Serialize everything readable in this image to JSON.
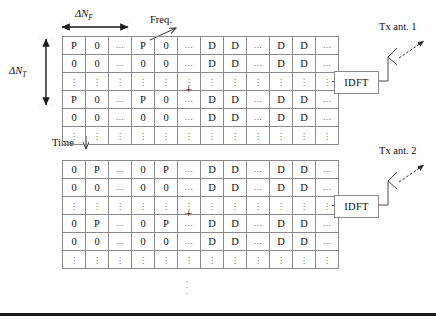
{
  "figure": {
    "axis_labels": {
      "frequency": "Freq.",
      "time": "Time",
      "delta_nf": "ΔN",
      "delta_nf_sub": "F",
      "delta_nt": "ΔN",
      "delta_nt_sub": "T"
    },
    "operator": "+",
    "block_label": "IDFT",
    "ellipsis_h": "...",
    "ellipsis_v": "⋮",
    "continuation_dots": [
      "·",
      "·",
      "·"
    ],
    "colors": {
      "grid_line": "#8a8a8a",
      "connector": "#4a4a4a",
      "text": "#111111",
      "rule": "#1a1a1a",
      "background": "#ffffff"
    },
    "branches": [
      {
        "id": "branch-1",
        "antenna_label": "Tx ant. 1",
        "pilot_grid": {
          "name": "pilot-grid-antenna-1",
          "columns": 6,
          "rows": [
            [
              "P",
              "0",
              "...",
              "P",
              "0",
              "..."
            ],
            [
              "0",
              "0",
              "...",
              "0",
              "0",
              "..."
            ],
            [
              "⋮",
              "⋮",
              "⋮",
              "⋮",
              "⋮",
              "⋮"
            ],
            [
              "P",
              "0",
              "...",
              "P",
              "0",
              "..."
            ],
            [
              "0",
              "0",
              "...",
              "0",
              "0",
              "..."
            ],
            [
              "⋮",
              "⋮",
              "⋮",
              "⋮",
              "⋮",
              "⋮"
            ]
          ]
        },
        "data_grid": {
          "name": "data-grid-antenna-1",
          "columns": 6,
          "rows": [
            [
              "D",
              "D",
              "...",
              "D",
              "D",
              "..."
            ],
            [
              "D",
              "D",
              "...",
              "D",
              "D",
              "..."
            ],
            [
              "⋮",
              "⋮",
              "⋮",
              "⋮",
              "⋮",
              "⋮"
            ],
            [
              "D",
              "D",
              "...",
              "D",
              "D",
              "..."
            ],
            [
              "D",
              "D",
              "...",
              "D",
              "D",
              "..."
            ],
            [
              "⋮",
              "⋮",
              "⋮",
              "⋮",
              "⋮",
              "⋮"
            ]
          ]
        }
      },
      {
        "id": "branch-2",
        "antenna_label": "Tx ant. 2",
        "pilot_grid": {
          "name": "pilot-grid-antenna-2",
          "columns": 6,
          "rows": [
            [
              "0",
              "P",
              "...",
              "0",
              "P",
              "..."
            ],
            [
              "0",
              "0",
              "...",
              "0",
              "0",
              "..."
            ],
            [
              "⋮",
              "⋮",
              "⋮",
              "⋮",
              "⋮",
              "⋮"
            ],
            [
              "0",
              "P",
              "...",
              "0",
              "P",
              "..."
            ],
            [
              "0",
              "0",
              "...",
              "0",
              "0",
              "..."
            ],
            [
              "⋮",
              "⋮",
              "⋮",
              "⋮",
              "⋮",
              "⋮"
            ]
          ]
        },
        "data_grid": {
          "name": "data-grid-antenna-2",
          "columns": 6,
          "rows": [
            [
              "D",
              "D",
              "...",
              "D",
              "D",
              "..."
            ],
            [
              "D",
              "D",
              "...",
              "D",
              "D",
              "..."
            ],
            [
              "⋮",
              "⋮",
              "⋮",
              "⋮",
              "⋮",
              "⋮"
            ],
            [
              "D",
              "D",
              "...",
              "D",
              "D",
              "..."
            ],
            [
              "D",
              "D",
              "...",
              "D",
              "D",
              "..."
            ],
            [
              "⋮",
              "⋮",
              "⋮",
              "⋮",
              "⋮",
              "⋮"
            ]
          ]
        }
      }
    ]
  }
}
